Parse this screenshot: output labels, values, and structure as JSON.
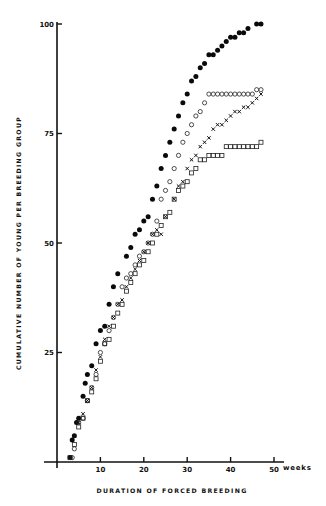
{
  "chart_data": {
    "type": "scatter",
    "title": "",
    "xlabel": "DURATION OF FORCED BREEDING",
    "x_unit": "weeks",
    "ylabel": "CUMULATIVE NUMBER OF YOUNG PER BREEDING GROUP",
    "xlim": [
      0,
      52
    ],
    "ylim": [
      0,
      100
    ],
    "x_ticks": [
      10,
      20,
      30,
      40,
      50
    ],
    "y_ticks": [
      25,
      50,
      75,
      100
    ],
    "grid": false,
    "legend": null,
    "series": [
      {
        "name": "filled-circle",
        "marker": "filled-circle",
        "points": [
          [
            3,
            1
          ],
          [
            3.5,
            5
          ],
          [
            4,
            6
          ],
          [
            4.5,
            9
          ],
          [
            5,
            10
          ],
          [
            6,
            15
          ],
          [
            6.5,
            18
          ],
          [
            7,
            20
          ],
          [
            8,
            22
          ],
          [
            9,
            27
          ],
          [
            10,
            30
          ],
          [
            11,
            31
          ],
          [
            12,
            36
          ],
          [
            13,
            40
          ],
          [
            14,
            43
          ],
          [
            16,
            47
          ],
          [
            17,
            49
          ],
          [
            18,
            52
          ],
          [
            19,
            53
          ],
          [
            20,
            55
          ],
          [
            21,
            56
          ],
          [
            22,
            60
          ],
          [
            23,
            63
          ],
          [
            24,
            67
          ],
          [
            25,
            70
          ],
          [
            26,
            73
          ],
          [
            27,
            76
          ],
          [
            28,
            79
          ],
          [
            29,
            82
          ],
          [
            30,
            84
          ],
          [
            31,
            87
          ],
          [
            32,
            88
          ],
          [
            33,
            90
          ],
          [
            34,
            91
          ],
          [
            35,
            93
          ],
          [
            36,
            93
          ],
          [
            37,
            94
          ],
          [
            38,
            95
          ],
          [
            39,
            96
          ],
          [
            40,
            97
          ],
          [
            41,
            97
          ],
          [
            42,
            98
          ],
          [
            43,
            98
          ],
          [
            44,
            99
          ],
          [
            46,
            100
          ],
          [
            47,
            100
          ]
        ]
      },
      {
        "name": "open-circle",
        "marker": "open-circle",
        "points": [
          [
            3.5,
            1
          ],
          [
            4,
            3
          ],
          [
            5,
            9
          ],
          [
            6,
            10
          ],
          [
            7,
            14
          ],
          [
            8,
            17
          ],
          [
            9,
            20
          ],
          [
            10,
            25
          ],
          [
            11,
            27
          ],
          [
            12,
            30
          ],
          [
            13,
            33
          ],
          [
            14,
            36
          ],
          [
            15,
            40
          ],
          [
            16,
            42
          ],
          [
            17,
            43
          ],
          [
            18,
            45
          ],
          [
            19,
            47
          ],
          [
            20,
            48
          ],
          [
            21,
            50
          ],
          [
            22,
            52
          ],
          [
            23,
            55
          ],
          [
            24,
            60
          ],
          [
            25,
            62
          ],
          [
            26,
            64
          ],
          [
            27,
            67
          ],
          [
            28,
            70
          ],
          [
            29,
            73
          ],
          [
            30,
            75
          ],
          [
            31,
            77
          ],
          [
            32,
            79
          ],
          [
            33,
            80
          ],
          [
            34,
            82
          ],
          [
            35,
            84
          ],
          [
            36,
            84
          ],
          [
            37,
            84
          ],
          [
            38,
            84
          ],
          [
            39,
            84
          ],
          [
            40,
            84
          ],
          [
            41,
            84
          ],
          [
            42,
            84
          ],
          [
            43,
            84
          ],
          [
            44,
            84
          ],
          [
            45,
            84
          ],
          [
            46,
            85
          ],
          [
            47,
            85
          ]
        ]
      },
      {
        "name": "cross",
        "marker": "x",
        "points": [
          [
            4,
            6
          ],
          [
            5,
            9
          ],
          [
            6,
            11
          ],
          [
            7,
            14
          ],
          [
            8,
            17
          ],
          [
            9,
            21
          ],
          [
            10,
            24
          ],
          [
            11,
            28
          ],
          [
            12,
            31
          ],
          [
            13,
            33
          ],
          [
            14,
            36
          ],
          [
            15,
            37
          ],
          [
            16,
            40
          ],
          [
            17,
            42
          ],
          [
            18,
            44
          ],
          [
            19,
            46
          ],
          [
            20,
            48
          ],
          [
            21,
            50
          ],
          [
            22,
            52
          ],
          [
            23,
            53
          ],
          [
            24,
            52
          ],
          [
            25,
            56
          ],
          [
            27,
            60
          ],
          [
            28,
            63
          ],
          [
            29,
            64
          ],
          [
            30,
            67
          ],
          [
            31,
            69
          ],
          [
            32,
            70
          ],
          [
            33,
            72
          ],
          [
            34,
            73
          ],
          [
            35,
            74
          ],
          [
            36,
            76
          ],
          [
            37,
            77
          ],
          [
            38,
            77
          ],
          [
            39,
            78
          ],
          [
            40,
            79
          ],
          [
            41,
            80
          ],
          [
            42,
            80
          ],
          [
            43,
            81
          ],
          [
            44,
            81
          ],
          [
            45,
            82
          ],
          [
            46,
            83
          ],
          [
            47,
            84
          ]
        ]
      },
      {
        "name": "open-square",
        "marker": "open-square",
        "points": [
          [
            3,
            1
          ],
          [
            4,
            4
          ],
          [
            5,
            8
          ],
          [
            6,
            10
          ],
          [
            7,
            14
          ],
          [
            8,
            16
          ],
          [
            9,
            19
          ],
          [
            10,
            23
          ],
          [
            11,
            27
          ],
          [
            12,
            28
          ],
          [
            13,
            31
          ],
          [
            14,
            34
          ],
          [
            15,
            36
          ],
          [
            16,
            39
          ],
          [
            17,
            41
          ],
          [
            18,
            43
          ],
          [
            19,
            45
          ],
          [
            20,
            46
          ],
          [
            21,
            48
          ],
          [
            22,
            50
          ],
          [
            23,
            52
          ],
          [
            24,
            54
          ],
          [
            25,
            56
          ],
          [
            26,
            57
          ],
          [
            27,
            60
          ],
          [
            28,
            62
          ],
          [
            29,
            63
          ],
          [
            30,
            64
          ],
          [
            31,
            66
          ],
          [
            32,
            67
          ],
          [
            33,
            69
          ],
          [
            34,
            69
          ],
          [
            35,
            70
          ],
          [
            36,
            70
          ],
          [
            37,
            70
          ],
          [
            38,
            70
          ],
          [
            39,
            72
          ],
          [
            40,
            72
          ],
          [
            41,
            72
          ],
          [
            42,
            72
          ],
          [
            43,
            72
          ],
          [
            44,
            72
          ],
          [
            45,
            72
          ],
          [
            46,
            72
          ],
          [
            47,
            73
          ]
        ]
      }
    ]
  },
  "labels": {
    "x_title": "DURATION OF FORCED BREEDING",
    "x_unit": "weeks",
    "y_title": "CUMULATIVE NUMBER OF YOUNG PER BREEDING GROUP",
    "x_tick_labels": [
      "10",
      "20",
      "30",
      "40",
      "50"
    ],
    "y_tick_labels": [
      "25",
      "50",
      "75",
      "100"
    ]
  }
}
